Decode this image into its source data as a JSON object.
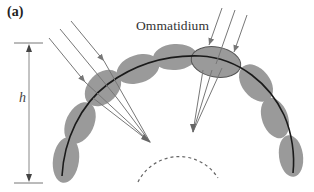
{
  "figure": {
    "panel_label": "(a)",
    "ommatidium_label": "Ommatidium",
    "height_label": "h",
    "colors": {
      "ommatidium_fill": "#9a9a9a",
      "ommatidium_outline": "#555555",
      "arc_line": "#1a1a1a",
      "ray": "#777777",
      "dashed_circle": "#666666",
      "bracket": "#777777"
    },
    "elements": {
      "ommatidia_count": 9,
      "left_ray_count": 3,
      "right_ray_count": 3,
      "highlighted_ommatidium": "top-right"
    }
  }
}
